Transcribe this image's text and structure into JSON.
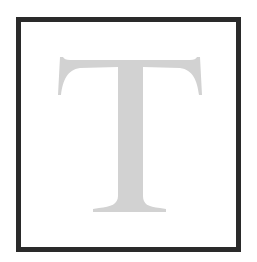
{
  "tile": {
    "letter": "T",
    "frame_color": "#2a2a2a",
    "letter_color": "#d2d2d2",
    "background_color": "#ffffff"
  }
}
